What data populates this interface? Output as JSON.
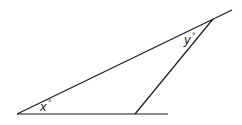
{
  "diagram": {
    "type": "geometry-angles",
    "labels": {
      "x_angle": "x",
      "y_angle": "y",
      "degree_symbol": "°"
    },
    "colors": {
      "line": "#1a1a1a",
      "background": "#ffffff"
    }
  }
}
